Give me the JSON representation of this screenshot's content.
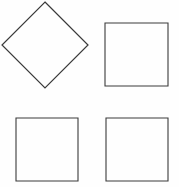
{
  "figure": {
    "background_color": "#fefefe",
    "stroke_color": "#3a3a3a",
    "fill": "none",
    "width": 179,
    "height": 187,
    "shape_count": "4"
  },
  "shapes": [
    {
      "id": "shape-top-left",
      "name": "rotated-square-diamond",
      "label": "Diamond (square rotated 45°)",
      "rotation": "45",
      "points": "45,2 88,45 45,88 2,45",
      "bounds": {
        "x": 2,
        "y": 2,
        "width": 86,
        "height": 86
      },
      "clipped": "top"
    },
    {
      "id": "shape-top-right",
      "name": "square-upright",
      "label": "Square",
      "rotation": "0",
      "points": "105,23 168,23 168,86 105,86",
      "bounds": {
        "x": 105,
        "y": 23,
        "width": 63,
        "height": 63
      },
      "clipped": "none"
    },
    {
      "id": "shape-bottom-left",
      "name": "square-upright",
      "label": "Square",
      "rotation": "0",
      "points": "16,118 78,118 78,181 16,181",
      "bounds": {
        "x": 16,
        "y": 118,
        "width": 62,
        "height": 63
      },
      "clipped": "none"
    },
    {
      "id": "shape-bottom-right",
      "name": "square-upright",
      "label": "Square",
      "rotation": "0",
      "points": "106,118 168,118 168,181 106,181",
      "bounds": {
        "x": 106,
        "y": 118,
        "width": 62,
        "height": 63
      },
      "clipped": "none"
    }
  ]
}
